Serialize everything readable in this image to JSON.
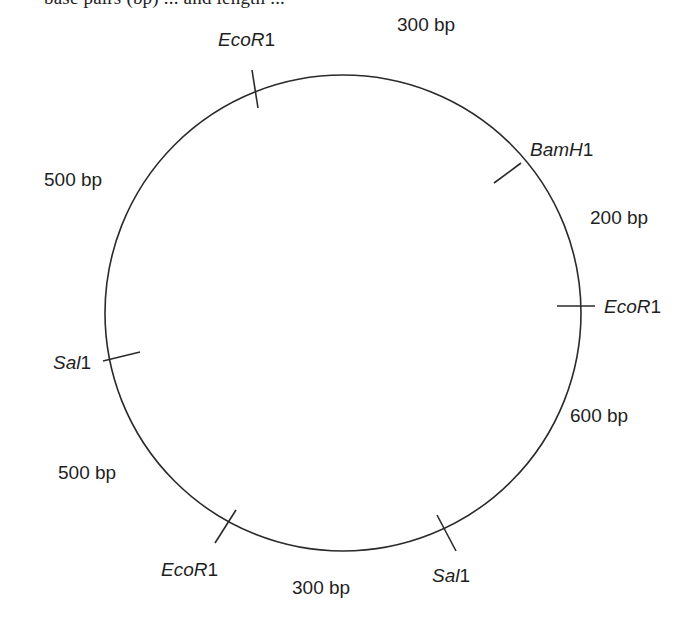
{
  "header": {
    "fragment_text": "base pairs (bp) ... and length ..."
  },
  "plasmid": {
    "shape": "circle",
    "center": [
      343,
      313
    ],
    "radius": 238,
    "stroke_color": "#2a2a2a",
    "sites": [
      {
        "id": "ecor1-top",
        "enzyme_italic": "EcoR",
        "enzyme_suffix": "1",
        "tick": [
          252,
          70,
          258,
          108
        ],
        "label_pos": [
          218,
          30
        ]
      },
      {
        "id": "bamh1",
        "enzyme_italic": "BamH",
        "enzyme_suffix": "1",
        "tick": [
          494,
          183,
          521,
          163
        ],
        "label_pos": [
          530,
          140
        ]
      },
      {
        "id": "ecor1-right",
        "enzyme_italic": "EcoR",
        "enzyme_suffix": "1",
        "tick": [
          557,
          306,
          595,
          306
        ],
        "label_pos": [
          604,
          297
        ]
      },
      {
        "id": "sal1-bottom",
        "enzyme_italic": "Sal",
        "enzyme_suffix": "1",
        "tick": [
          437,
          515,
          456,
          551
        ],
        "label_pos": [
          432,
          566
        ]
      },
      {
        "id": "ecor1-bottom",
        "enzyme_italic": "EcoR",
        "enzyme_suffix": "1",
        "tick": [
          215,
          543,
          236,
          510
        ],
        "label_pos": [
          161,
          560
        ]
      },
      {
        "id": "sal1-left",
        "enzyme_italic": "Sal",
        "enzyme_suffix": "1",
        "tick": [
          103,
          361,
          140,
          352
        ],
        "label_pos": [
          53,
          353
        ]
      }
    ],
    "fragments": [
      {
        "id": "frag-ecor1-bamh1",
        "label": "300 bp",
        "label_pos": [
          397,
          15
        ]
      },
      {
        "id": "frag-bamh1-ecor1",
        "label": "200 bp",
        "label_pos": [
          590,
          208
        ]
      },
      {
        "id": "frag-ecor1-sal1",
        "label": "600 bp",
        "label_pos": [
          570,
          406
        ]
      },
      {
        "id": "frag-sal1-ecor1",
        "label": "300 bp",
        "label_pos": [
          292,
          578
        ]
      },
      {
        "id": "frag-ecor1-sal1-left",
        "label": "500 bp",
        "label_pos": [
          58,
          463
        ]
      },
      {
        "id": "frag-sal1-ecor1-top",
        "label": "500 bp",
        "label_pos": [
          44,
          170
        ]
      }
    ]
  }
}
